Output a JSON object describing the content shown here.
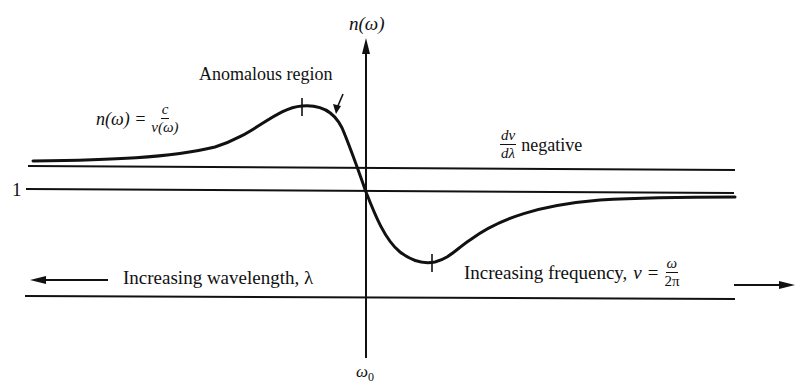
{
  "diagram": {
    "colors": {
      "ink": "#111111",
      "background": "#ffffff"
    },
    "axis": {
      "y_label": "n(ω)",
      "x_marker_label": "ω",
      "x_marker_subscript": "0",
      "unity_label": "1"
    },
    "labels": {
      "anomalous_region": "Anomalous region",
      "n_formula_lhs": "n(ω) =",
      "n_formula_num": "c",
      "n_formula_den": "v(ω)",
      "dv_num": "dv",
      "dv_den": "dλ",
      "dv_suffix": "negative",
      "increasing_wavelength": "Increasing wavelength, λ",
      "increasing_frequency": "Increasing frequency,",
      "nu_symbol": "ν =",
      "freq_num": "ω",
      "freq_den": "2π"
    },
    "curve": {
      "description": "n(ω) rises slowly from left, peaks before ω0, falls steeply through 1 at ω0 (anomalous region), dips to a minimum, then recovers toward a constant just below 1",
      "marked_points": [
        "maximum (left of ω0)",
        "minimum (right of ω0)"
      ]
    },
    "reference_lines": [
      {
        "name": "upper-asymptote-line",
        "y": 167
      },
      {
        "name": "unity-line",
        "y": 190
      },
      {
        "name": "frequency-axis-line",
        "y": 297
      }
    ]
  }
}
